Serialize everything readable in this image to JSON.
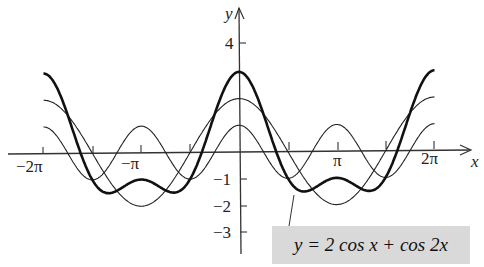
{
  "chart_data": {
    "type": "line",
    "title": "",
    "xlabel": "x",
    "ylabel": "y",
    "xlim": [
      -6.8,
      6.9
    ],
    "ylim": [
      -4,
      4.8
    ],
    "x_ticks": [
      "−2π",
      "−π",
      "π",
      "2π"
    ],
    "x_tick_values": [
      -6.283,
      -3.1416,
      3.1416,
      6.283
    ],
    "y_ticks": [
      "4",
      "−1",
      "−2",
      "−3"
    ],
    "y_tick_values": [
      4,
      -1,
      -2,
      -3
    ],
    "grid": false,
    "series": [
      {
        "name": "y = 2 cos x + cos 2x",
        "style": "thick",
        "x_range": [
          -6.283,
          6.283
        ],
        "peak": 3,
        "min": -1.5
      },
      {
        "name": "y = 2 cos x",
        "style": "thin",
        "x_range": [
          -6.283,
          6.283
        ],
        "peak": 2,
        "min": -2
      },
      {
        "name": "y = cos 2x",
        "style": "thin",
        "x_range": [
          -6.283,
          6.283
        ],
        "peak": 1,
        "min": -1
      }
    ],
    "annotation": "y = 2 cos x + cos 2x"
  },
  "labels": {
    "y_axis": "y",
    "x_axis": "x",
    "tick_neg2pi": "−2π",
    "tick_negpi": "−π",
    "tick_pi": "π",
    "tick_2pi": "2π",
    "tick_4": "4",
    "tick_m1": "−1",
    "tick_m2": "−2",
    "tick_m3": "−3",
    "equation": "y = 2 cos x + cos 2x"
  }
}
